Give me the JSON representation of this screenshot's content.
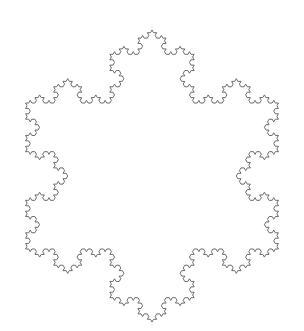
{
  "figure": {
    "width": 304,
    "height": 331,
    "background": "#ffffff",
    "stroke_color": "#6b6b6b",
    "stroke_width": 1,
    "center": [
      152,
      176
    ],
    "radius": 146,
    "iterations": 4,
    "orientation": "vertex-up"
  }
}
